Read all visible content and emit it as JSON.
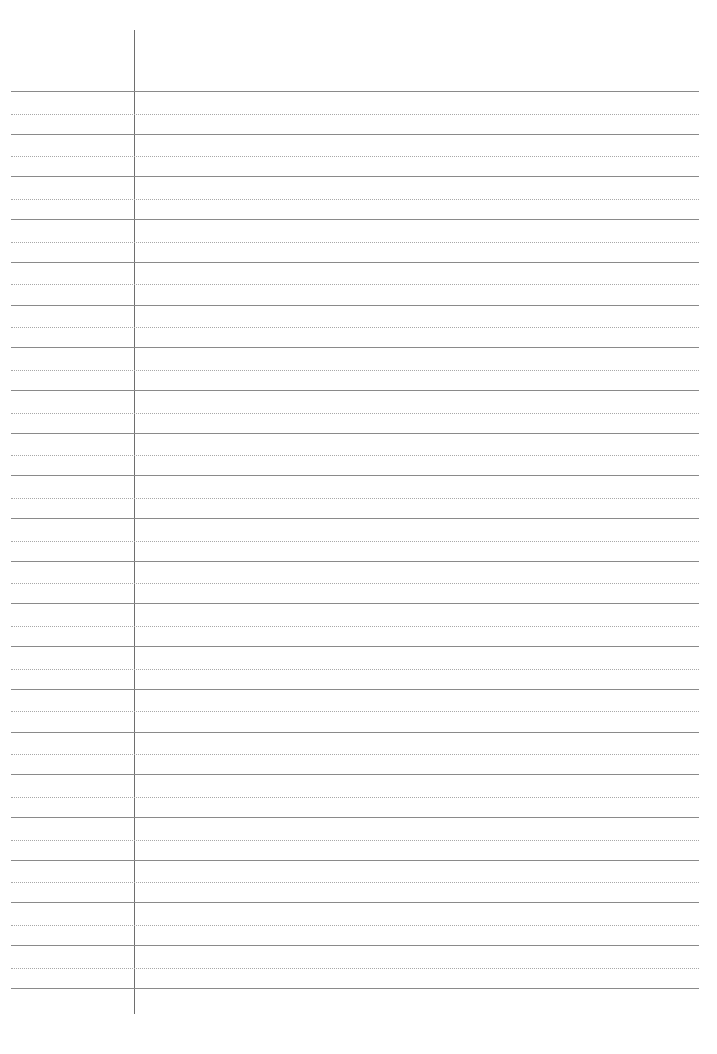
{
  "page": {
    "type": "lined-notebook-paper",
    "background_color": "#ffffff",
    "rule_color": "#8a8a8a",
    "dotted_rule_color": "#a8a8a8",
    "margin_line_color": "#6e6e6e",
    "margin_line_x": 134,
    "margin_line_top": 30,
    "margin_line_bottom": 1014,
    "rule_left": 11,
    "rule_right": 699,
    "first_rule_y": 91,
    "rule_spacing": 42.7,
    "solid_rule_count": 22
  }
}
